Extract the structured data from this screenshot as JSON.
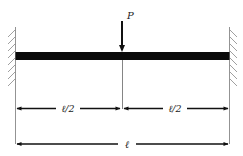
{
  "diagram": {
    "load": {
      "label": "P",
      "position": "midspan"
    },
    "supports": {
      "left": "fixed",
      "right": "fixed"
    },
    "dimensions": {
      "left_half": "ℓ/2",
      "right_half": "ℓ/2",
      "total": "ℓ"
    },
    "colors": {
      "stroke": "#1a1a1a",
      "beam": "#0a0a0a",
      "thin": "#555555"
    }
  }
}
